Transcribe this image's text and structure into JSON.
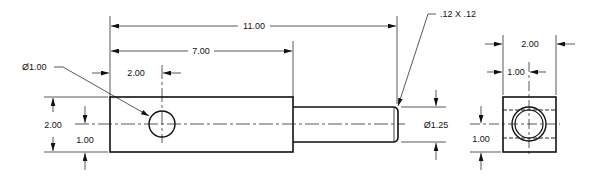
{
  "drawing": {
    "front_view": {
      "overall_length": "11.00",
      "block_length": "7.00",
      "hole_position": "2.00",
      "hole_diameter": "Ø1.00",
      "block_height": "2.00",
      "hole_height": "1.00",
      "shaft_diameter": "Ø1.25",
      "chamfer": ".12 X .12"
    },
    "side_view": {
      "width": "2.00",
      "hole_offset_x": "1.00",
      "hole_offset_y": "1.00"
    },
    "colors": {
      "line": "#111111",
      "background": "#ffffff"
    }
  }
}
